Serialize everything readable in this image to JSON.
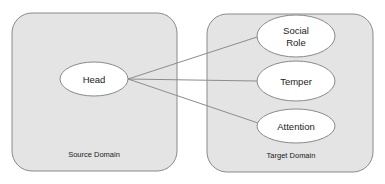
{
  "source_domain": {
    "label": "Source Domain",
    "nodes": [
      {
        "id": "head",
        "label": "Head"
      }
    ]
  },
  "target_domain": {
    "label": "Target Domain",
    "nodes": [
      {
        "id": "social_role",
        "label_line1": "Social",
        "label_line2": "Role"
      },
      {
        "id": "temper",
        "label": "Temper"
      },
      {
        "id": "attention",
        "label": "Attention"
      }
    ]
  },
  "edges": [
    {
      "from": "Head",
      "to": "Social Role"
    },
    {
      "from": "Head",
      "to": "Temper"
    },
    {
      "from": "Head",
      "to": "Attention"
    }
  ],
  "colors": {
    "box_fill": "#e4e4e4",
    "box_stroke": "#8a8a8a",
    "node_fill": "#ffffff",
    "line": "#8c8c8c"
  }
}
